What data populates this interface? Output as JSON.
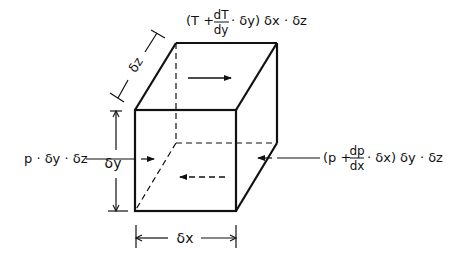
{
  "diagram": {
    "type": "fluid-element-force-balance",
    "colors": {
      "line": "#111111",
      "background": "#ffffff"
    },
    "top_label": {
      "open": "(T +",
      "frac_num": "dT",
      "frac_den": "dy",
      "close": "· δy) δx · δz"
    },
    "left_label": "p · δy · δz",
    "right_label": {
      "open": "(p +",
      "frac_num": "dp",
      "frac_den": "dx",
      "close": "· δx) δy · δz"
    },
    "dimensions": {
      "dz": "δz",
      "dy": "δy",
      "dx": "δx"
    },
    "arrows": [
      {
        "name": "top-face-shear-arrow",
        "direction": "right",
        "style": "solid"
      },
      {
        "name": "bottom-face-shear-arrow",
        "direction": "left",
        "style": "dashed"
      },
      {
        "name": "left-pressure-arrow",
        "direction": "right",
        "style": "solid"
      },
      {
        "name": "right-pressure-arrow",
        "direction": "left",
        "style": "solid"
      }
    ]
  }
}
